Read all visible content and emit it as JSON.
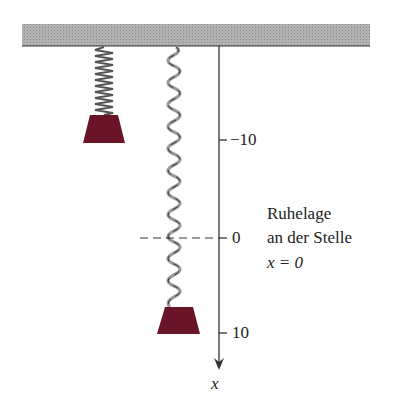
{
  "diagram": {
    "type": "spring-mass system",
    "ceiling": {
      "color": "#a8a8a8"
    },
    "mass_color": "#6a1428",
    "axis": {
      "label": "x",
      "ticks": [
        {
          "value": "−10"
        },
        {
          "value": "0"
        },
        {
          "value": "10"
        }
      ]
    },
    "annotation": {
      "line1": "Ruhelage",
      "line2": "an der Stelle",
      "line3": "x = 0"
    }
  }
}
